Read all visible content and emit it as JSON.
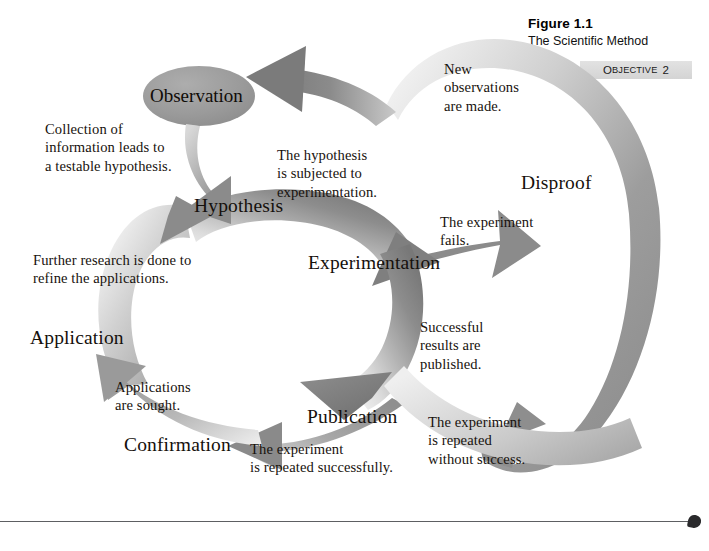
{
  "figure": {
    "number": "Figure 1.1",
    "title": "The Scientific Method"
  },
  "objective_badge": {
    "word_first_letter": "O",
    "word_rest": "BJECTIVE",
    "number": "2",
    "background": "#d9d9d9"
  },
  "diagram": {
    "type": "cycle-flow",
    "colors": {
      "arrow_dark": "#7d7d7d",
      "arrow_mid": "#9b9b9b",
      "arrow_light": "#ededed",
      "ellipse": "#9a9a9a",
      "text": "#15100c"
    },
    "start_node": {
      "label": "Observation",
      "shape": "ellipse"
    },
    "nodes": [
      {
        "id": "hypothesis",
        "label": "Hypothesis"
      },
      {
        "id": "experimentation",
        "label": "Experimentation"
      },
      {
        "id": "disproof",
        "label": "Disproof"
      },
      {
        "id": "publication",
        "label": "Publication"
      },
      {
        "id": "confirmation",
        "label": "Confirmation"
      },
      {
        "id": "application",
        "label": "Application"
      }
    ],
    "captions": [
      {
        "id": "collection",
        "text": "Collection of information leads to a testable hypothesis."
      },
      {
        "id": "subjected",
        "text": "The hypothesis is subjected to experimentation."
      },
      {
        "id": "new-observations",
        "text": "New observations are made."
      },
      {
        "id": "experiment-fails",
        "text": "The experiment fails."
      },
      {
        "id": "repeated-without",
        "text": "The experiment is repeated without success."
      },
      {
        "id": "successful",
        "text": "Successful results are published."
      },
      {
        "id": "repeated-success",
        "text": "The experiment is repeated successfully."
      },
      {
        "id": "applications",
        "text": "Applications are sought."
      },
      {
        "id": "further-research",
        "text": "Further research is done to refine the applications."
      }
    ],
    "caption_lines": {
      "collection": [
        "Collection of",
        "information leads to",
        "a testable hypothesis."
      ],
      "subjected": [
        "The hypothesis",
        "is subjected to",
        "experimentation."
      ],
      "new_observations": [
        "New",
        "observations",
        "are made."
      ],
      "experiment_fails": [
        "The experiment",
        "fails."
      ],
      "repeated_without": [
        "The experiment",
        "is repeated",
        "without success."
      ],
      "successful": [
        "Successful",
        "results are",
        "published."
      ],
      "repeated_success": [
        "The experiment",
        "is repeated successfully."
      ],
      "applications": [
        "Applications",
        "are sought."
      ],
      "further_research": [
        "Further research is done to",
        "refine the applications."
      ]
    }
  }
}
